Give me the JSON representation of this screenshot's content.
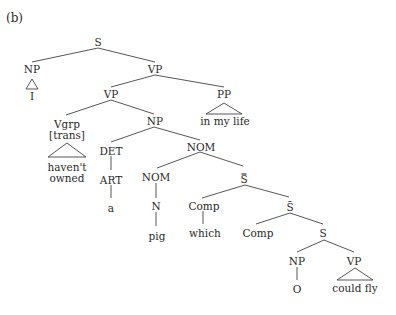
{
  "figure_label": "(b)",
  "tree": {
    "nodes": {
      "s_root": "S",
      "np_subj": "NP",
      "np_subj_leaf": "I",
      "vp_top": "VP",
      "vp_mid": "VP",
      "pp": "PP",
      "pp_leaf": "in my life",
      "vgrp": "Vgrp",
      "vgrp_feature": "[trans]",
      "vgrp_leaf_1": "haven't",
      "vgrp_leaf_2": "owned",
      "np_obj": "NP",
      "det": "DET",
      "art": "ART",
      "art_leaf": "a",
      "nom_top": "NOM",
      "nom_sub": "NOM",
      "n": "N",
      "n_leaf": "pig",
      "s_dbar": "S̿",
      "comp_1": "Comp",
      "comp_1_leaf": "which",
      "s_bar": "S̄",
      "comp_2": "Comp",
      "s_inner": "S",
      "np_inner": "NP",
      "np_inner_leaf": "O",
      "vp_inner": "VP",
      "vp_inner_leaf": "could fly"
    }
  }
}
